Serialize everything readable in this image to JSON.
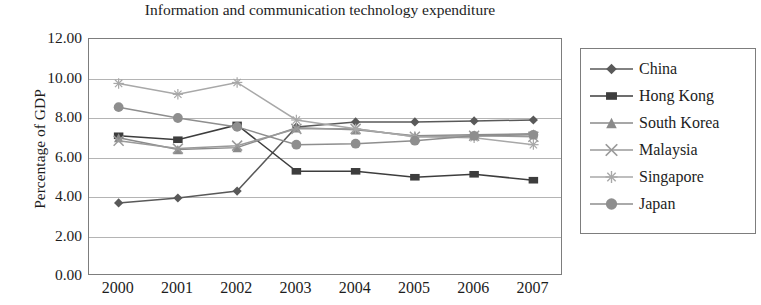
{
  "chart_data": {
    "type": "line",
    "title": "Information and communication technology expenditure",
    "subtitle": "",
    "xlabel": "",
    "ylabel": "Percentage of GDP",
    "categories": [
      "2000",
      "2001",
      "2002",
      "2003",
      "2004",
      "2005",
      "2006",
      "2007"
    ],
    "x": [
      2000,
      2001,
      2002,
      2003,
      2004,
      2005,
      2006,
      2007
    ],
    "ylim": [
      0,
      12
    ],
    "ytick_labels": [
      "12.00",
      "10.00",
      "8.00",
      "6.00",
      "4.00",
      "2.00",
      "0.00"
    ],
    "ytick_values": [
      12,
      10,
      8,
      6,
      4,
      2,
      0
    ],
    "grid": true,
    "legend_position": "right",
    "series": [
      {
        "name": "China",
        "marker": "diamond",
        "color": "#595959",
        "values": [
          3.7,
          3.95,
          4.3,
          7.55,
          7.8,
          7.8,
          7.85,
          7.9
        ]
      },
      {
        "name": "Hong Kong",
        "marker": "square",
        "color": "#3d3d3d",
        "values": [
          7.1,
          6.9,
          7.65,
          5.3,
          5.3,
          5.0,
          5.15,
          4.85
        ]
      },
      {
        "name": "South Korea",
        "marker": "triangle",
        "color": "#8a8a8a",
        "values": [
          7.0,
          6.4,
          6.5,
          7.5,
          7.4,
          7.1,
          7.15,
          7.2
        ]
      },
      {
        "name": "Malaysia",
        "marker": "cross",
        "color": "#9a9a9a",
        "values": [
          6.85,
          6.45,
          6.6,
          7.45,
          7.45,
          7.05,
          7.1,
          7.05
        ]
      },
      {
        "name": "Singapore",
        "marker": "asterisk",
        "color": "#a8a8a8",
        "values": [
          9.75,
          9.2,
          9.8,
          7.9,
          7.45,
          7.05,
          7.0,
          6.65
        ]
      },
      {
        "name": "Japan",
        "marker": "circle",
        "color": "#8e8e8e",
        "values": [
          8.55,
          8.0,
          7.55,
          6.65,
          6.7,
          6.85,
          7.1,
          7.15
        ]
      }
    ]
  },
  "legend": {
    "items": [
      {
        "label": "China"
      },
      {
        "label": "Hong Kong"
      },
      {
        "label": "South Korea"
      },
      {
        "label": "Malaysia"
      },
      {
        "label": "Singapore"
      },
      {
        "label": "Japan"
      }
    ]
  },
  "caption": {
    "text": ""
  }
}
